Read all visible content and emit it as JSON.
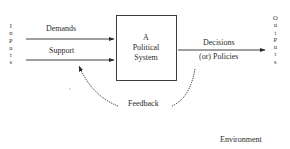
{
  "diagram": {
    "type": "systems-model",
    "inputs_label": [
      "I",
      "n",
      "P",
      "u",
      "t",
      "s"
    ],
    "outputs_label": [
      "O",
      "u",
      "t",
      "P",
      "u",
      "t",
      "s"
    ],
    "input_arrows": [
      {
        "label": "Demands"
      },
      {
        "label": "Support"
      }
    ],
    "system_box": {
      "lines": [
        "A",
        "Political",
        "System"
      ]
    },
    "output_arrow": {
      "label_line1": "Decisions",
      "label_line2": "(or) Policies"
    },
    "feedback_label": "Feedback",
    "environment_label": "Environment",
    "colors": {
      "line": "#2a2a2a",
      "text": "#2a2a2a",
      "background": "#ffffff"
    }
  }
}
